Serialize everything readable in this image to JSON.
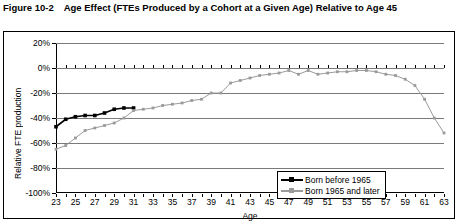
{
  "figure": {
    "label": "Figure 10-2",
    "caption": "Age Effect (FTEs Produced by a Cohort at a Given Age) Relative to Age 45"
  },
  "legend": {
    "position": "inside-bottom-right",
    "items": [
      {
        "label": "Born before 1965",
        "color": "#000000",
        "marker": "square"
      },
      {
        "label": "Born 1965 and later",
        "color": "#9a9a9a",
        "marker": "square"
      }
    ]
  },
  "chart_data": {
    "type": "line",
    "title": "Age Effect (FTEs Produced by a Cohort at a Given Age) Relative to Age 45",
    "xlabel": "Age",
    "ylabel": "Relative FTE production",
    "xlim": [
      23,
      63
    ],
    "ylim": [
      -100,
      20
    ],
    "ytick_labels": [
      "20%",
      "0%",
      "-20%",
      "-40%",
      "-60%",
      "-80%",
      "-100%"
    ],
    "ytick_values": [
      20,
      0,
      -20,
      -40,
      -60,
      -80,
      -100
    ],
    "xtick_labels": [
      "23",
      "25",
      "27",
      "29",
      "31",
      "33",
      "35",
      "37",
      "39",
      "41",
      "43",
      "45",
      "47",
      "49",
      "51",
      "53",
      "55",
      "57",
      "59",
      "61",
      "63"
    ],
    "xtick_values": [
      23,
      25,
      27,
      29,
      31,
      33,
      35,
      37,
      39,
      41,
      43,
      45,
      47,
      49,
      51,
      53,
      55,
      57,
      59,
      61,
      63
    ],
    "grid": "horizontal",
    "series": [
      {
        "name": "Born before 1965",
        "color": "#000000",
        "x": [
          23,
          24,
          25,
          26,
          27,
          28,
          29,
          30,
          31
        ],
        "values": [
          -47,
          -41,
          -39,
          -38,
          -38,
          -36,
          -33,
          -32,
          -32
        ]
      },
      {
        "name": "Born 1965 and later",
        "color": "#9a9a9a",
        "x": [
          23,
          24,
          25,
          26,
          27,
          28,
          29,
          30,
          31,
          32,
          33,
          34,
          35,
          36,
          37,
          38,
          39,
          40,
          41,
          42,
          43,
          44,
          45,
          46,
          47,
          48,
          49,
          50,
          51,
          52,
          53,
          54,
          55,
          56,
          57,
          58,
          59,
          60,
          61,
          62,
          63
        ],
        "values": [
          -65,
          -62,
          -56,
          -50,
          -48,
          -46,
          -44,
          -40,
          -34,
          -33,
          -32,
          -30,
          -29,
          -28,
          -26,
          -25,
          -20,
          -20,
          -12,
          -10,
          -8,
          -6,
          -5,
          -4,
          -2,
          -5,
          -2,
          -5,
          -4,
          -3,
          -3,
          -2,
          -2,
          -3,
          -5,
          -6,
          -9,
          -14,
          -25,
          -40,
          -52
        ]
      }
    ]
  }
}
